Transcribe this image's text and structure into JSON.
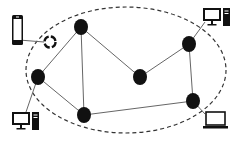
{
  "diagram": {
    "type": "network-topology",
    "colors": {
      "background": "#ffffff",
      "node": "#111111",
      "edge": "#666666",
      "boundary": "#333333",
      "device": "#111111"
    },
    "boundary": {
      "shape": "ellipse",
      "style": "dashed",
      "cx": 126,
      "cy": 70,
      "rx": 100,
      "ry": 63
    },
    "nodes": [
      {
        "id": "n1",
        "x": 81,
        "y": 27
      },
      {
        "id": "n2",
        "x": 38,
        "y": 77
      },
      {
        "id": "n3",
        "x": 140,
        "y": 77
      },
      {
        "id": "n4",
        "x": 189,
        "y": 44
      },
      {
        "id": "n5",
        "x": 84,
        "y": 115
      },
      {
        "id": "n6",
        "x": 193,
        "y": 101
      }
    ],
    "edges": [
      {
        "from": "n1",
        "to": "n2"
      },
      {
        "from": "n1",
        "to": "n5"
      },
      {
        "from": "n1",
        "to": "n3"
      },
      {
        "from": "n3",
        "to": "n4"
      },
      {
        "from": "n4",
        "to": "n6"
      },
      {
        "from": "n2",
        "to": "n5"
      },
      {
        "from": "n5",
        "to": "n6"
      }
    ],
    "devices": [
      {
        "type": "smartphone-icon",
        "x": 12,
        "y": 15,
        "link_to": "sync-icon"
      },
      {
        "type": "sync-icon",
        "x": 50,
        "y": 42
      },
      {
        "type": "desktop-computer-icon",
        "x": 203,
        "y": 8,
        "link_to": "n4"
      },
      {
        "type": "desktop-computer-icon",
        "x": 12,
        "y": 112,
        "link_to": "n2"
      },
      {
        "type": "laptop-icon",
        "x": 203,
        "y": 112,
        "link_to": "n6"
      }
    ]
  }
}
